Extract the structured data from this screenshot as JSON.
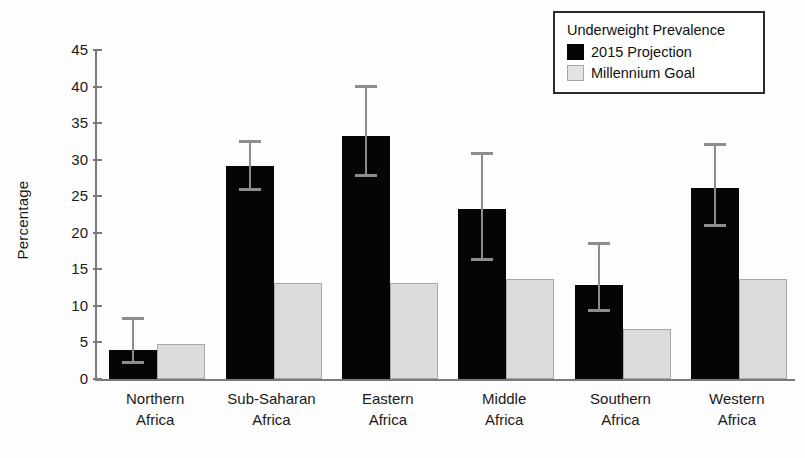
{
  "chart_data": {
    "type": "bar",
    "title": "",
    "xlabel": "",
    "ylabel": "Percentage",
    "ylim": [
      0,
      45
    ],
    "yticks": [
      0,
      5,
      10,
      15,
      20,
      25,
      30,
      35,
      40,
      45
    ],
    "grid": false,
    "legend": {
      "position": "top-right",
      "title": "Underweight Prevalence",
      "entries": [
        {
          "name": "2015 Projection",
          "color": "#050505"
        },
        {
          "name": "Millennium Goal",
          "color": "#dcdcdc"
        }
      ]
    },
    "categories": [
      {
        "line1": "Northern",
        "line2": "Africa"
      },
      {
        "line1": "Sub-Saharan",
        "line2": "Africa"
      },
      {
        "line1": "Eastern",
        "line2": "Africa"
      },
      {
        "line1": "Middle",
        "line2": "Africa"
      },
      {
        "line1": "Southern",
        "line2": "Africa"
      },
      {
        "line1": "Western",
        "line2": "Africa"
      }
    ],
    "series": [
      {
        "name": "2015 Projection",
        "color": "#050505",
        "values": [
          4.0,
          29.2,
          33.3,
          23.2,
          12.9,
          26.1
        ],
        "errors_low": [
          2.0,
          25.7,
          27.6,
          16.2,
          9.2,
          20.8
        ],
        "errors_high": [
          8.1,
          32.3,
          39.8,
          30.7,
          18.3,
          31.9
        ]
      },
      {
        "name": "Millennium Goal",
        "color": "#dcdcdc",
        "values": [
          4.8,
          13.2,
          13.2,
          13.7,
          6.9,
          13.7
        ],
        "errors_low": [
          null,
          null,
          null,
          null,
          null,
          null
        ],
        "errors_high": [
          null,
          null,
          null,
          null,
          null,
          null
        ]
      }
    ]
  }
}
